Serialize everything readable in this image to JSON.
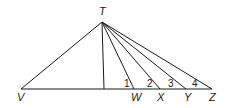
{
  "diagram": {
    "points": {
      "T": {
        "label": "T",
        "x": 102,
        "y": 22
      },
      "V": {
        "label": "V",
        "x": 21,
        "y": 89
      },
      "foot": {
        "x": 104,
        "y": 89
      },
      "W": {
        "label": "W",
        "x": 134,
        "y": 89
      },
      "X": {
        "label": "X",
        "x": 160,
        "y": 89
      },
      "Y": {
        "label": "Y",
        "x": 186,
        "y": 89
      },
      "Z": {
        "label": "Z",
        "x": 212,
        "y": 89
      }
    },
    "angles": [
      {
        "label": "1"
      },
      {
        "label": "2"
      },
      {
        "label": "3"
      },
      {
        "label": "4"
      }
    ],
    "stroke_color": "#1a1a1a"
  }
}
